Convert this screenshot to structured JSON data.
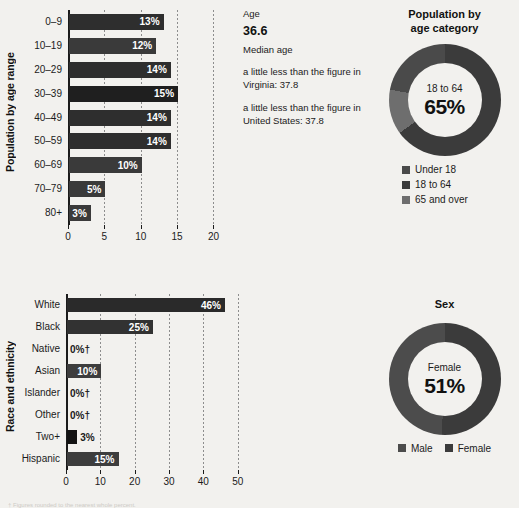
{
  "colors": {
    "background": "#f2f1ee",
    "bar_dark": "#2b2b2b",
    "bar_mid": "#3f3f3f",
    "bar_darkest": "#1a1a1a",
    "axis": "#1b1b1b",
    "grid": "#8d8d8d",
    "donut_dark": "#3b3b3b",
    "donut_mid": "#555555",
    "donut_light": "#7d7d7d",
    "value_text_on_bar": "#ffffff",
    "value_text_off_bar": "#1b1b1b"
  },
  "age_chart": {
    "axis_title": "Population by age range",
    "categories": [
      "0–9",
      "10–19",
      "20–29",
      "30–39",
      "40–49",
      "50–59",
      "60–69",
      "70–79",
      "80+"
    ],
    "values": [
      13,
      12,
      14,
      15,
      14,
      14,
      10,
      5,
      3
    ],
    "labels": [
      "13%",
      "12%",
      "14%",
      "15%",
      "14%",
      "14%",
      "10%",
      "5%",
      "3%"
    ],
    "ticks": [
      "0",
      "5",
      "10",
      "15",
      "20"
    ],
    "tick_values": [
      0,
      5,
      10,
      15,
      20
    ],
    "xlim": [
      0,
      22
    ]
  },
  "race_chart": {
    "axis_title": "Race and ethnicity",
    "categories": [
      "White",
      "Black",
      "Native",
      "Asian",
      "Islander",
      "Other",
      "Two+",
      "Hispanic"
    ],
    "values": [
      46,
      25,
      0,
      10,
      0,
      0,
      3,
      15
    ],
    "labels": [
      "46%",
      "25%",
      "0%†",
      "10%",
      "0%†",
      "0%†",
      "3%",
      "15%"
    ],
    "ticks": [
      "0",
      "10",
      "20",
      "30",
      "40",
      "50"
    ],
    "tick_values": [
      0,
      10,
      20,
      30,
      40,
      50
    ],
    "xlim": [
      0,
      53
    ]
  },
  "stats": {
    "label": "Age",
    "value": "36.6",
    "sublabel": "Median age",
    "note_state": "a little less than the figure in Virginia: 37.8",
    "note_country": "a little less than the figure in United States: 37.8"
  },
  "age_category_donut": {
    "title_line1": "Population by",
    "title_line2": "age category",
    "center_category": "18 to 64",
    "center_value": "65%",
    "segments": [
      {
        "name": "18 to 64",
        "value": 65,
        "color": "#3b3b3b"
      },
      {
        "name": "65 and over",
        "value": 13,
        "color": "#6e6e6e"
      },
      {
        "name": "Under 18",
        "value": 22,
        "color": "#4a4a4a"
      }
    ],
    "legend": [
      {
        "name": "Under 18",
        "color": "#4a4a4a"
      },
      {
        "name": "18 to 64",
        "color": "#3b3b3b"
      },
      {
        "name": "65 and over",
        "color": "#6e6e6e"
      }
    ]
  },
  "sex_donut": {
    "title": "Sex",
    "center_category": "Female",
    "center_value": "51%",
    "segments": [
      {
        "name": "Female",
        "value": 51,
        "color": "#3b3b3b"
      },
      {
        "name": "Male",
        "value": 49,
        "color": "#4c4c4c"
      }
    ],
    "legend": [
      {
        "name": "Male",
        "color": "#4c4c4c"
      },
      {
        "name": "Female",
        "color": "#3b3b3b"
      }
    ]
  },
  "footnote": {
    "text": "† Figures rounded to the nearest whole percent."
  },
  "chart_data": [
    {
      "type": "bar",
      "orientation": "horizontal",
      "title": "Population by age range",
      "categories": [
        "0–9",
        "10–19",
        "20–29",
        "30–39",
        "40–49",
        "50–59",
        "60–69",
        "70–79",
        "80+"
      ],
      "values": [
        13,
        12,
        14,
        15,
        14,
        14,
        10,
        5,
        3
      ],
      "xlabel": "",
      "ylabel": "Population by age range",
      "xlim": [
        0,
        22
      ],
      "xticks": [
        0,
        5,
        10,
        15,
        20
      ],
      "grid": true,
      "legend": null,
      "datalabels": [
        "13%",
        "12%",
        "14%",
        "15%",
        "14%",
        "14%",
        "10%",
        "5%",
        "3%"
      ]
    },
    {
      "type": "bar",
      "orientation": "horizontal",
      "title": "Race and ethnicity",
      "categories": [
        "White",
        "Black",
        "Native",
        "Asian",
        "Islander",
        "Other",
        "Two+",
        "Hispanic"
      ],
      "values": [
        46,
        25,
        0,
        10,
        0,
        0,
        3,
        15
      ],
      "xlabel": "",
      "ylabel": "Race and ethnicity",
      "xlim": [
        0,
        53
      ],
      "xticks": [
        0,
        10,
        20,
        30,
        40,
        50
      ],
      "grid": true,
      "legend": null,
      "datalabels": [
        "46%",
        "25%",
        "0%†",
        "10%",
        "0%†",
        "0%†",
        "3%",
        "15%"
      ]
    },
    {
      "type": "pie",
      "subtype": "donut",
      "title": "Population by age category",
      "categories": [
        "Under 18",
        "18 to 64",
        "65 and over"
      ],
      "values": [
        22,
        65,
        13
      ],
      "center_label": "18 to 64",
      "center_value": "65%",
      "legend": "bottom"
    },
    {
      "type": "pie",
      "subtype": "donut",
      "title": "Sex",
      "categories": [
        "Male",
        "Female"
      ],
      "values": [
        49,
        51
      ],
      "center_label": "Female",
      "center_value": "51%",
      "legend": "bottom"
    }
  ]
}
